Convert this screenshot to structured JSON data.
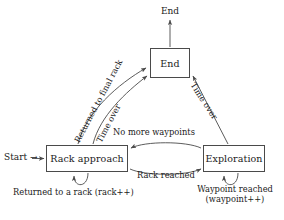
{
  "diagram": {
    "type": "state-diagram",
    "background_color": "#ffffff",
    "line_color": "#4a4a4a",
    "text_color": "#1a1a1a",
    "states": [
      {
        "id": "rack-approach",
        "label": "Rack approach"
      },
      {
        "id": "exploration",
        "label": "Exploration"
      },
      {
        "id": "end",
        "label": "End"
      }
    ],
    "terminals": {
      "start_label": "Start",
      "start_arrow_glyph": "→",
      "end_label": "End"
    },
    "transitions": {
      "rack_to_end_returned": "Returned to final rack",
      "rack_to_end_timeover": "Time over",
      "exploration_to_end_timeover": "Time over",
      "exploration_to_rack": "No more waypoints",
      "rack_to_exploration": "Rack reached",
      "rack_self_loop": "Returned to a rack (rack++)",
      "exploration_self_loop_line1": "Waypoint reached",
      "exploration_self_loop_line2": "(waypoint++)"
    }
  }
}
